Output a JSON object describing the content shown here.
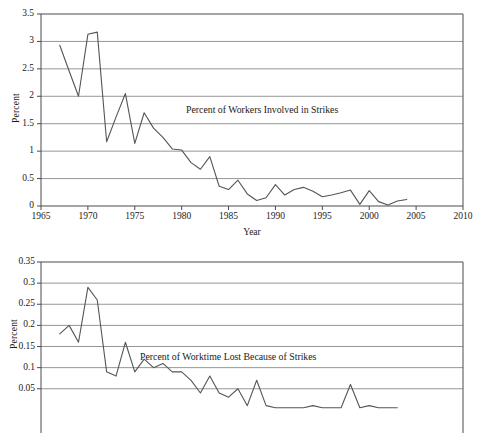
{
  "page": {
    "background": "#ffffff",
    "line_color": "#555555",
    "grid_color": "#8a8a8a",
    "axis_color": "#4a4a4a",
    "text_color": "#1a1a1a",
    "clipped_header_text": ""
  },
  "chart_data": [
    {
      "id": "workers-involved",
      "type": "line",
      "title": "",
      "annotation": "Percent of Workers Involved in Strikes",
      "xlabel": "Year",
      "ylabel": "Percent",
      "xlim": [
        1965,
        2010
      ],
      "ylim": [
        0,
        3.5
      ],
      "xticks": [
        1965,
        1970,
        1975,
        1980,
        1985,
        1990,
        1995,
        2000,
        2005,
        2010
      ],
      "yticks": [
        0,
        0.5,
        1,
        1.5,
        2,
        2.5,
        3,
        3.5
      ],
      "ytick_labels": [
        "0",
        "0.5",
        "1",
        "1.5",
        "2",
        "2.5",
        "3",
        "3.5"
      ],
      "xtick_labels": [
        "1965",
        "1970",
        "1975",
        "1980",
        "1985",
        "1990",
        "1995",
        "2000",
        "2005",
        "2010"
      ],
      "grid": "horizontal",
      "legend": "none",
      "x": [
        1967,
        1968,
        1969,
        1970,
        1971,
        1972,
        1973,
        1974,
        1975,
        1976,
        1977,
        1978,
        1979,
        1980,
        1981,
        1982,
        1983,
        1984,
        1985,
        1986,
        1987,
        1988,
        1989,
        1990,
        1991,
        1992,
        1993,
        1994,
        1995,
        1996,
        1997,
        1998,
        1999,
        2000,
        2001,
        2002,
        2003,
        2004
      ],
      "values": [
        2.93,
        2.46,
        2.0,
        3.13,
        3.17,
        1.17,
        1.62,
        2.05,
        1.14,
        1.7,
        1.42,
        1.25,
        1.04,
        1.02,
        0.79,
        0.67,
        0.9,
        0.36,
        0.3,
        0.47,
        0.22,
        0.1,
        0.15,
        0.39,
        0.2,
        0.3,
        0.34,
        0.27,
        0.17,
        0.2,
        0.24,
        0.29,
        0.03,
        0.28,
        0.08,
        0.02,
        0.09,
        0.12
      ]
    },
    {
      "id": "worktime-lost",
      "type": "line",
      "title": "",
      "annotation": "Percent of Worktime Lost Because of Strikes",
      "xlabel": "",
      "ylabel": "Percent",
      "xlim": [
        1965,
        2010
      ],
      "ylim": [
        0,
        0.35
      ],
      "yticks": [
        0.05,
        0.1,
        0.15,
        0.2,
        0.25,
        0.3,
        0.35
      ],
      "ytick_labels": [
        "0.05",
        "0.1",
        "0.15",
        "0.2",
        "0.25",
        "0.3",
        "0.35"
      ],
      "xticks": [],
      "xtick_labels": [],
      "grid": "horizontal",
      "legend": "none",
      "clipped_bottom": true,
      "x": [
        1967,
        1968,
        1969,
        1970,
        1971,
        1972,
        1973,
        1974,
        1975,
        1976,
        1977,
        1978,
        1979,
        1980,
        1981,
        1982,
        1983,
        1984,
        1985,
        1986,
        1987,
        1988,
        1989,
        1990,
        1991,
        1992,
        1993,
        1994,
        1995,
        1996,
        1997,
        1998,
        1999,
        2000,
        2001,
        2002,
        2003
      ],
      "values": [
        0.18,
        0.2,
        0.16,
        0.29,
        0.26,
        0.09,
        0.08,
        0.16,
        0.09,
        0.12,
        0.1,
        0.11,
        0.09,
        0.09,
        0.07,
        0.04,
        0.08,
        0.04,
        0.03,
        0.05,
        0.01,
        0.07,
        0.01,
        0.005,
        0.005,
        0.005,
        0.005,
        0.01,
        0.005,
        0.005,
        0.005,
        0.06,
        0.005,
        0.01,
        0.005,
        0.005,
        0.005
      ]
    }
  ]
}
